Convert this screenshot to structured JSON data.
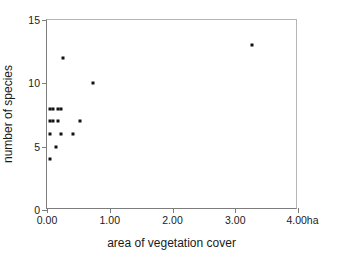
{
  "chart_data": {
    "type": "scatter",
    "title": "",
    "xlabel": "area of vegetation cover",
    "ylabel": "number of species",
    "xunit": "ha",
    "xlim": [
      0,
      4
    ],
    "ylim": [
      0,
      15
    ],
    "xticks": [
      0,
      1,
      2,
      3,
      4
    ],
    "xticklabels": [
      "0.00",
      "1.00",
      "2.00",
      "3.00",
      "4.00"
    ],
    "yticks": [
      0,
      5,
      10,
      15
    ],
    "yticklabels": [
      "0",
      "5",
      "10",
      "15"
    ],
    "grid": false,
    "legend": false,
    "marker": "square",
    "marker_color": "#111111",
    "axis_color": "#7d7d7d",
    "points": [
      {
        "x": 0.05,
        "y": 8
      },
      {
        "x": 0.1,
        "y": 8
      },
      {
        "x": 0.18,
        "y": 8
      },
      {
        "x": 0.23,
        "y": 8
      },
      {
        "x": 0.05,
        "y": 7
      },
      {
        "x": 0.1,
        "y": 7
      },
      {
        "x": 0.17,
        "y": 7
      },
      {
        "x": 0.52,
        "y": 7
      },
      {
        "x": 0.04,
        "y": 6
      },
      {
        "x": 0.23,
        "y": 6
      },
      {
        "x": 0.42,
        "y": 6
      },
      {
        "x": 0.14,
        "y": 5
      },
      {
        "x": 0.05,
        "y": 4
      },
      {
        "x": 0.26,
        "y": 12
      },
      {
        "x": 0.74,
        "y": 10
      },
      {
        "x": 3.26,
        "y": 13
      }
    ]
  }
}
